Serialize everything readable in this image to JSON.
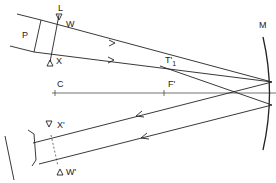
{
  "figure": {
    "labels": {
      "L": "L",
      "W": "W",
      "P": "P",
      "X": "X",
      "T1": "T'",
      "T1_sub": "1",
      "C": "C",
      "F": "F'",
      "M": "M",
      "X_prime": "X'",
      "W_prime": "W'"
    },
    "colors": {
      "line": "#222222",
      "background": "#ffffff"
    }
  }
}
